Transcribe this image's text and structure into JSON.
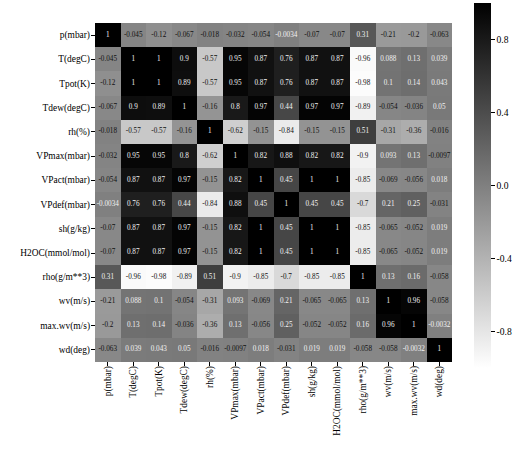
{
  "chart_data": {
    "type": "heatmap",
    "title": "",
    "xlabel": "",
    "ylabel": "",
    "cmap": "gray_reversed",
    "grid": false,
    "legend_position": "right",
    "colorbar": {
      "vmin": -1.0,
      "vmax": 1.0,
      "ticks": [
        "0.8",
        "0.4",
        "0.0",
        "-0.4",
        "-0.8"
      ],
      "tick_values": [
        0.8,
        0.4,
        0.0,
        -0.4,
        -0.8
      ],
      "orientation": "vertical",
      "dark_is_high": true
    },
    "categories": [
      "p(mbar)",
      "T(degC)",
      "Tpot(K)",
      "Tdew(degC)",
      "rh(%)",
      "VPmax(mbar)",
      "VPact(mbar)",
      "VPdef(mbar)",
      "sh(g/kg)",
      "H2OC(mmol/mol)",
      "rho(g/m**3)",
      "wv(m/s)",
      "max.wv(m/s)",
      "wd(deg)"
    ],
    "row_labels": [
      "p(mbar)",
      "T(degC)",
      "Tpot(K)",
      "Tdew(degC)",
      "rh(%)",
      "VPmax(mbar)",
      "VPact(mbar)",
      "VPdef(mbar)",
      "sh(g/kg)",
      "H2OC(mmol/mol)",
      "rho(g/m**3)",
      "wv(m/s)",
      "max.wv(m/s)",
      "wd(deg)"
    ],
    "values": [
      [
        1,
        -0.045,
        -0.12,
        -0.067,
        -0.018,
        -0.032,
        -0.054,
        -0.0034,
        -0.07,
        -0.07,
        0.31,
        -0.21,
        -0.2,
        -0.063
      ],
      [
        -0.045,
        1,
        1,
        0.9,
        -0.57,
        0.95,
        0.87,
        0.76,
        0.87,
        0.87,
        -0.96,
        0.088,
        0.13,
        0.039
      ],
      [
        -0.12,
        1,
        1,
        0.89,
        -0.57,
        0.95,
        0.87,
        0.76,
        0.87,
        0.87,
        -0.98,
        0.1,
        0.14,
        0.043
      ],
      [
        -0.067,
        0.9,
        0.89,
        1,
        -0.16,
        0.8,
        0.97,
        0.44,
        0.97,
        0.97,
        -0.89,
        -0.054,
        -0.036,
        0.05
      ],
      [
        -0.018,
        -0.57,
        -0.57,
        -0.16,
        1,
        -0.62,
        -0.15,
        -0.84,
        -0.15,
        -0.15,
        0.51,
        -0.31,
        -0.36,
        -0.016
      ],
      [
        -0.032,
        0.95,
        0.95,
        0.8,
        -0.62,
        1,
        0.82,
        0.88,
        0.82,
        0.82,
        -0.9,
        0.093,
        0.13,
        -0.0097
      ],
      [
        -0.054,
        0.87,
        0.87,
        0.97,
        -0.15,
        0.82,
        1,
        0.45,
        1,
        1,
        -0.85,
        -0.069,
        -0.056,
        0.018
      ],
      [
        -0.0034,
        0.76,
        0.76,
        0.44,
        -0.84,
        0.88,
        0.45,
        1,
        0.45,
        0.45,
        -0.7,
        0.21,
        0.25,
        -0.031
      ],
      [
        -0.07,
        0.87,
        0.87,
        0.97,
        -0.15,
        0.82,
        1,
        0.45,
        1,
        1,
        -0.85,
        -0.065,
        -0.052,
        0.019
      ],
      [
        -0.07,
        0.87,
        0.87,
        0.97,
        -0.15,
        0.82,
        1,
        0.45,
        1,
        1,
        -0.85,
        -0.065,
        -0.052,
        0.019
      ],
      [
        0.31,
        -0.96,
        -0.98,
        -0.89,
        0.51,
        -0.9,
        -0.85,
        -0.7,
        -0.85,
        -0.85,
        1,
        0.13,
        0.16,
        -0.058
      ],
      [
        -0.21,
        0.088,
        0.1,
        -0.054,
        -0.31,
        0.093,
        -0.069,
        0.21,
        -0.065,
        -0.065,
        0.13,
        1,
        0.96,
        -0.058
      ],
      [
        -0.2,
        0.13,
        0.14,
        -0.036,
        -0.36,
        0.13,
        -0.056,
        0.25,
        -0.052,
        -0.052,
        0.16,
        0.96,
        1,
        -0.0032
      ],
      [
        -0.063,
        0.039,
        0.043,
        0.05,
        -0.016,
        -0.0097,
        0.018,
        -0.031,
        0.019,
        0.019,
        -0.058,
        -0.058,
        -0.0032,
        1
      ]
    ],
    "labels": [
      [
        "1",
        "-0.045",
        "-0.12",
        "-0.067",
        "-0.018",
        "-0.032",
        "-0.054",
        "-0.0034",
        "-0.07",
        "-0.07",
        "0.31",
        "-0.21",
        "-0.2",
        "-0.063"
      ],
      [
        "-0.045",
        "1",
        "1",
        "0.9",
        "-0.57",
        "0.95",
        "0.87",
        "0.76",
        "0.87",
        "0.87",
        "-0.96",
        "0.088",
        "0.13",
        "0.039"
      ],
      [
        "-0.12",
        "1",
        "1",
        "0.89",
        "-0.57",
        "0.95",
        "0.87",
        "0.76",
        "0.87",
        "0.87",
        "-0.98",
        "0.1",
        "0.14",
        "0.043"
      ],
      [
        "-0.067",
        "0.9",
        "0.89",
        "1",
        "-0.16",
        "0.8",
        "0.97",
        "0.44",
        "0.97",
        "0.97",
        "-0.89",
        "-0.054",
        "-0.036",
        "0.05"
      ],
      [
        "-0.018",
        "-0.57",
        "-0.57",
        "-0.16",
        "1",
        "-0.62",
        "-0.15",
        "-0.84",
        "-0.15",
        "-0.15",
        "0.51",
        "-0.31",
        "-0.36",
        "-0.016"
      ],
      [
        "-0.032",
        "0.95",
        "0.95",
        "0.8",
        "-0.62",
        "1",
        "0.82",
        "0.88",
        "0.82",
        "0.82",
        "-0.9",
        "0.093",
        "0.13",
        "-0.0097"
      ],
      [
        "-0.054",
        "0.87",
        "0.87",
        "0.97",
        "-0.15",
        "0.82",
        "1",
        "0.45",
        "1",
        "1",
        "-0.85",
        "-0.069",
        "-0.056",
        "0.018"
      ],
      [
        "-0.0034",
        "0.76",
        "0.76",
        "0.44",
        "-0.84",
        "0.88",
        "0.45",
        "1",
        "0.45",
        "0.45",
        "-0.7",
        "0.21",
        "0.25",
        "-0.031"
      ],
      [
        "-0.07",
        "0.87",
        "0.87",
        "0.97",
        "-0.15",
        "0.82",
        "1",
        "0.45",
        "1",
        "1",
        "-0.85",
        "-0.065",
        "-0.052",
        "0.019"
      ],
      [
        "-0.07",
        "0.87",
        "0.87",
        "0.97",
        "-0.15",
        "0.82",
        "1",
        "0.45",
        "1",
        "1",
        "-0.85",
        "-0.065",
        "-0.052",
        "0.019"
      ],
      [
        "0.31",
        "-0.96",
        "-0.98",
        "-0.89",
        "0.51",
        "-0.9",
        "-0.85",
        "-0.7",
        "-0.85",
        "-0.85",
        "1",
        "0.13",
        "0.16",
        "-0.058"
      ],
      [
        "-0.21",
        "0.088",
        "0.1",
        "-0.054",
        "-0.31",
        "0.093",
        "-0.069",
        "0.21",
        "-0.065",
        "-0.065",
        "0.13",
        "1",
        "0.96",
        "-0.058"
      ],
      [
        "-0.2",
        "0.13",
        "0.14",
        "-0.036",
        "-0.36",
        "0.13",
        "-0.056",
        "0.25",
        "-0.052",
        "-0.052",
        "0.16",
        "0.96",
        "1",
        "-0.0032"
      ],
      [
        "-0.063",
        "0.039",
        "0.043",
        "0.05",
        "-0.016",
        "-0.0097",
        "0.018",
        "-0.031",
        "0.019",
        "0.019",
        "-0.058",
        "-0.058",
        "-0.0032",
        "1"
      ]
    ]
  }
}
